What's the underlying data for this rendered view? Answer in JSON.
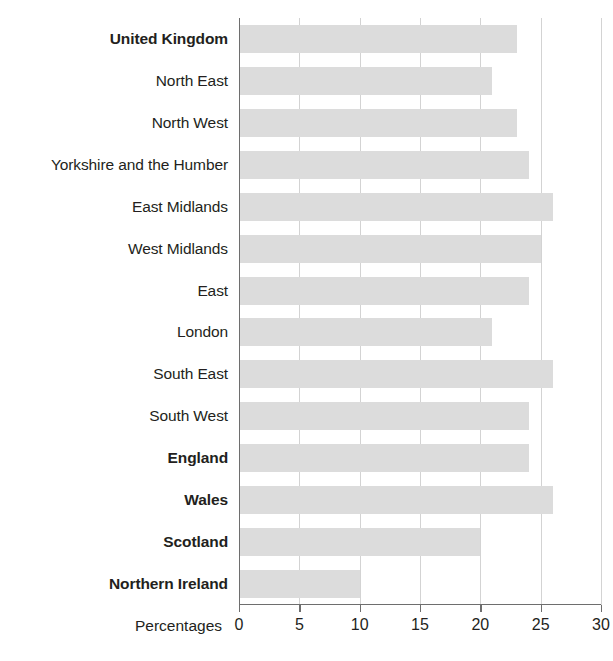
{
  "chart_data": {
    "type": "bar",
    "orientation": "horizontal",
    "title": "",
    "subtitle": "",
    "xlabel": "Percentages",
    "ylabel": "",
    "xlim": [
      0,
      30
    ],
    "xticks": [
      0,
      5,
      10,
      15,
      20,
      25,
      30
    ],
    "xtick_labels": [
      "0",
      "5",
      "10",
      "15",
      "20",
      "25",
      "30"
    ],
    "grid": true,
    "grid_axis": "x",
    "legend": false,
    "bar_color": "#dcdcdc",
    "axis_color": "#6e6e6e",
    "gridline_color": "#d3d3d3",
    "text_color": "#231f20",
    "categories": [
      "United Kingdom",
      "North East",
      "North West",
      "Yorkshire and the Humber",
      "East Midlands",
      "West Midlands",
      "East",
      "London",
      "South East",
      "South West",
      "England",
      "Wales",
      "Scotland",
      "Northern Ireland"
    ],
    "values": [
      23,
      21,
      23,
      24,
      26,
      25,
      24,
      21,
      26,
      24,
      24,
      26,
      20,
      10
    ],
    "emphasis": [
      true,
      false,
      false,
      false,
      false,
      false,
      false,
      false,
      false,
      false,
      true,
      true,
      true,
      true
    ]
  }
}
